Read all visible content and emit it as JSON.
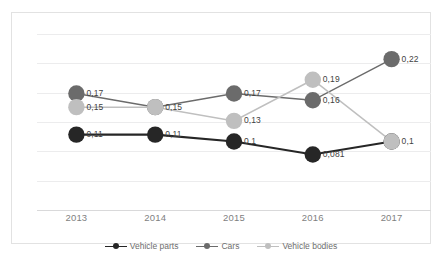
{
  "chart_data": {
    "type": "line",
    "title": "",
    "xlabel": "",
    "ylabel": "",
    "categories": [
      "2013",
      "2014",
      "2015",
      "2016",
      "2017"
    ],
    "ylim": [
      0.0,
      0.2567
    ],
    "grid": true,
    "legend_position": "bottom",
    "decimal_separator": ",",
    "series": [
      {
        "name": "Vehicle parts",
        "color": "#262626",
        "values": [
          0.11,
          0.11,
          0.1,
          0.081,
          0.1
        ],
        "labels": [
          "0,11",
          "0,11",
          "0,1",
          "0,081",
          ""
        ]
      },
      {
        "name": "Cars",
        "color": "#6b6b6b",
        "values": [
          0.17,
          0.15,
          0.17,
          0.16,
          0.22
        ],
        "labels": [
          "0,17",
          "",
          "0,17",
          "0,16",
          "0,22"
        ]
      },
      {
        "name": "Vehicle bodies",
        "color": "#bfbfbf",
        "values": [
          0.15,
          0.15,
          0.13,
          0.19,
          0.1
        ],
        "labels": [
          "0,15",
          "0,15",
          "0,13",
          "0,19",
          "0,1"
        ]
      }
    ]
  },
  "axis": {
    "tick_labels": [
      "2013",
      "2014",
      "2015",
      "2016",
      "2017"
    ]
  },
  "legend": {
    "items": [
      {
        "label": "Vehicle parts",
        "color": "#262626"
      },
      {
        "label": "Cars",
        "color": "#6b6b6b"
      },
      {
        "label": "Vehicle bodies",
        "color": "#bfbfbf"
      }
    ]
  }
}
